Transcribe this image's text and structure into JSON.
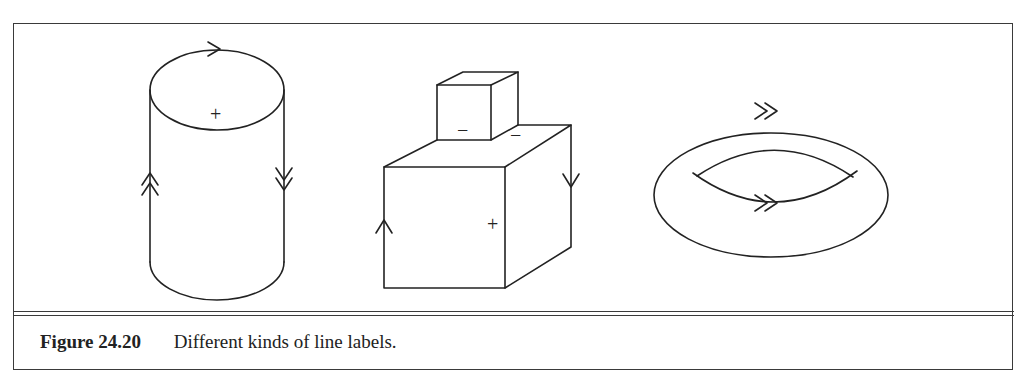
{
  "figure": {
    "number": "Figure 24.20",
    "caption": "Different kinds of line labels."
  },
  "drawings": [
    {
      "name": "cylinder",
      "labels": [
        "+"
      ],
      "arrows": [
        "single arrow on top ellipse (pointing right)",
        "double arrow on left side (up)",
        "double arrow on right side (down)"
      ]
    },
    {
      "name": "stacked-boxes",
      "labels": [
        "−",
        "−",
        "+"
      ],
      "arrows": [
        "single arrow on left edge (up)",
        "single arrow on right back edge (down)"
      ]
    },
    {
      "name": "torus",
      "labels": [],
      "arrows": [
        "double arrow on outer ellipse top (right)",
        "double arrow on inner lens bottom (right)"
      ]
    }
  ],
  "labels": {
    "cyl_plus": "+",
    "box_minus_1": "−",
    "box_minus_2": "−",
    "box_plus": "+"
  },
  "colors": {
    "ink": "#222222",
    "frame": "#3a3a3a",
    "background": "#ffffff"
  }
}
